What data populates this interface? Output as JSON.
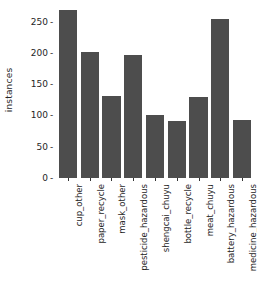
{
  "chart_data": {
    "type": "bar",
    "title": "",
    "xlabel": "",
    "ylabel": "instances",
    "categories": [
      "cup_other",
      "paper_recycle",
      "mask_other",
      "pesticide_hazardous",
      "shengcai_chuyu",
      "bottle_recycle",
      "meat_chuyu",
      "battery_hazardous",
      "medicine_hazardous"
    ],
    "values": [
      268,
      202,
      131,
      197,
      101,
      91,
      130,
      255,
      93
    ],
    "ylim": [
      0,
      275
    ],
    "yticks": [
      0,
      50,
      100,
      150,
      200,
      250
    ],
    "ytick_labels": [
      "0",
      "50",
      "100",
      "150",
      "200",
      "250"
    ],
    "grid": false,
    "legend": false,
    "bar_color": "#4d4d4d",
    "background_color": "#ffffff",
    "tick_dash": "-"
  }
}
